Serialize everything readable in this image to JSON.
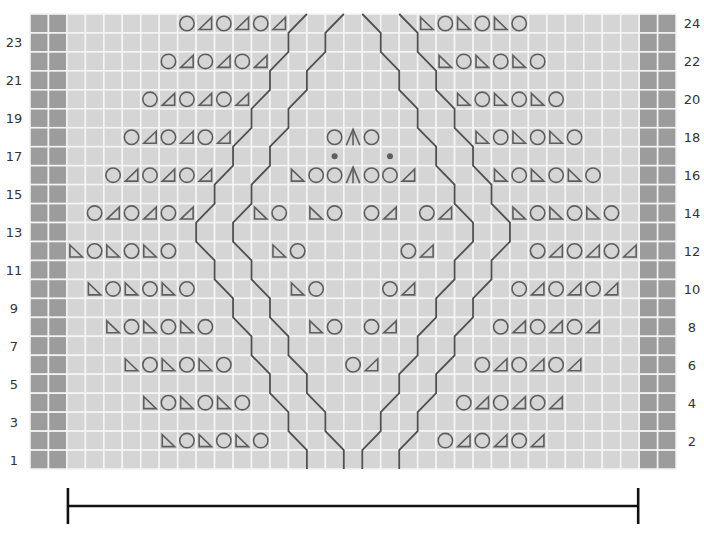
{
  "chart": {
    "type": "knitting-lace-chart",
    "columns": 35,
    "rows": 24,
    "edge_columns": {
      "left": [
        0,
        1
      ],
      "right": [
        33,
        34
      ]
    },
    "colors": {
      "cell": "#d5d5d5",
      "edge_cell": "#9c9c9c",
      "grid_line": "#f4f4f4",
      "symbol": "#5e5e5e",
      "cable_line": "#4f4f4f",
      "label": "#333333",
      "bracket": "#111111"
    },
    "row_labels": {
      "left": [
        "1",
        "3",
        "5",
        "7",
        "9",
        "11",
        "13",
        "15",
        "17",
        "19",
        "21",
        "23"
      ],
      "right": [
        "2",
        "4",
        "6",
        "8",
        "10",
        "12",
        "14",
        "16",
        "18",
        "20",
        "22",
        "24"
      ]
    },
    "symbol_legend": {
      "yo": "circle",
      "k2tog": "triangle-right-leaning",
      "ssk": "triangle-left-leaning",
      "cdd": "up-caret",
      "dot": "filled-dot"
    },
    "rows_data": {
      "24": [
        {
          "c": 8,
          "s": "yo"
        },
        {
          "c": 9,
          "s": "k2tog"
        },
        {
          "c": 10,
          "s": "yo"
        },
        {
          "c": 11,
          "s": "k2tog"
        },
        {
          "c": 12,
          "s": "yo"
        },
        {
          "c": 13,
          "s": "k2tog"
        },
        {
          "c": 21,
          "s": "ssk"
        },
        {
          "c": 22,
          "s": "yo"
        },
        {
          "c": 23,
          "s": "ssk"
        },
        {
          "c": 24,
          "s": "yo"
        },
        {
          "c": 25,
          "s": "ssk"
        },
        {
          "c": 26,
          "s": "yo"
        }
      ],
      "22": [
        {
          "c": 7,
          "s": "yo"
        },
        {
          "c": 8,
          "s": "k2tog"
        },
        {
          "c": 9,
          "s": "yo"
        },
        {
          "c": 10,
          "s": "k2tog"
        },
        {
          "c": 11,
          "s": "yo"
        },
        {
          "c": 12,
          "s": "k2tog"
        },
        {
          "c": 22,
          "s": "ssk"
        },
        {
          "c": 23,
          "s": "yo"
        },
        {
          "c": 24,
          "s": "ssk"
        },
        {
          "c": 25,
          "s": "yo"
        },
        {
          "c": 26,
          "s": "ssk"
        },
        {
          "c": 27,
          "s": "yo"
        }
      ],
      "20": [
        {
          "c": 6,
          "s": "yo"
        },
        {
          "c": 7,
          "s": "k2tog"
        },
        {
          "c": 8,
          "s": "yo"
        },
        {
          "c": 9,
          "s": "k2tog"
        },
        {
          "c": 10,
          "s": "yo"
        },
        {
          "c": 11,
          "s": "k2tog"
        },
        {
          "c": 23,
          "s": "ssk"
        },
        {
          "c": 24,
          "s": "yo"
        },
        {
          "c": 25,
          "s": "ssk"
        },
        {
          "c": 26,
          "s": "yo"
        },
        {
          "c": 27,
          "s": "ssk"
        },
        {
          "c": 28,
          "s": "yo"
        }
      ],
      "18": [
        {
          "c": 5,
          "s": "yo"
        },
        {
          "c": 6,
          "s": "k2tog"
        },
        {
          "c": 7,
          "s": "yo"
        },
        {
          "c": 8,
          "s": "k2tog"
        },
        {
          "c": 9,
          "s": "yo"
        },
        {
          "c": 10,
          "s": "k2tog"
        },
        {
          "c": 16,
          "s": "yo"
        },
        {
          "c": 17,
          "s": "cdd"
        },
        {
          "c": 18,
          "s": "yo"
        },
        {
          "c": 24,
          "s": "ssk"
        },
        {
          "c": 25,
          "s": "yo"
        },
        {
          "c": 26,
          "s": "ssk"
        },
        {
          "c": 27,
          "s": "yo"
        },
        {
          "c": 28,
          "s": "ssk"
        },
        {
          "c": 29,
          "s": "yo"
        }
      ],
      "17": [
        {
          "c": 16,
          "s": "dot"
        },
        {
          "c": 19,
          "s": "dot"
        }
      ],
      "16": [
        {
          "c": 4,
          "s": "yo"
        },
        {
          "c": 5,
          "s": "k2tog"
        },
        {
          "c": 6,
          "s": "yo"
        },
        {
          "c": 7,
          "s": "k2tog"
        },
        {
          "c": 8,
          "s": "yo"
        },
        {
          "c": 9,
          "s": "k2tog"
        },
        {
          "c": 14,
          "s": "ssk"
        },
        {
          "c": 15,
          "s": "yo"
        },
        {
          "c": 16,
          "s": "yo"
        },
        {
          "c": 17,
          "s": "cdd"
        },
        {
          "c": 18,
          "s": "yo"
        },
        {
          "c": 19,
          "s": "yo"
        },
        {
          "c": 20,
          "s": "k2tog"
        },
        {
          "c": 25,
          "s": "ssk"
        },
        {
          "c": 26,
          "s": "yo"
        },
        {
          "c": 27,
          "s": "ssk"
        },
        {
          "c": 28,
          "s": "yo"
        },
        {
          "c": 29,
          "s": "ssk"
        },
        {
          "c": 30,
          "s": "yo"
        }
      ],
      "14": [
        {
          "c": 3,
          "s": "yo"
        },
        {
          "c": 4,
          "s": "k2tog"
        },
        {
          "c": 5,
          "s": "yo"
        },
        {
          "c": 6,
          "s": "k2tog"
        },
        {
          "c": 7,
          "s": "yo"
        },
        {
          "c": 8,
          "s": "k2tog"
        },
        {
          "c": 12,
          "s": "ssk"
        },
        {
          "c": 13,
          "s": "yo"
        },
        {
          "c": 15,
          "s": "ssk"
        },
        {
          "c": 16,
          "s": "yo"
        },
        {
          "c": 18,
          "s": "yo"
        },
        {
          "c": 19,
          "s": "k2tog"
        },
        {
          "c": 21,
          "s": "yo"
        },
        {
          "c": 22,
          "s": "k2tog"
        },
        {
          "c": 26,
          "s": "ssk"
        },
        {
          "c": 27,
          "s": "yo"
        },
        {
          "c": 28,
          "s": "ssk"
        },
        {
          "c": 29,
          "s": "yo"
        },
        {
          "c": 30,
          "s": "ssk"
        },
        {
          "c": 31,
          "s": "yo"
        }
      ],
      "12": [
        {
          "c": 2,
          "s": "ssk"
        },
        {
          "c": 3,
          "s": "yo"
        },
        {
          "c": 4,
          "s": "ssk"
        },
        {
          "c": 5,
          "s": "yo"
        },
        {
          "c": 6,
          "s": "ssk"
        },
        {
          "c": 7,
          "s": "yo"
        },
        {
          "c": 13,
          "s": "ssk"
        },
        {
          "c": 14,
          "s": "yo"
        },
        {
          "c": 20,
          "s": "yo"
        },
        {
          "c": 21,
          "s": "k2tog"
        },
        {
          "c": 27,
          "s": "yo"
        },
        {
          "c": 28,
          "s": "k2tog"
        },
        {
          "c": 29,
          "s": "yo"
        },
        {
          "c": 30,
          "s": "k2tog"
        },
        {
          "c": 31,
          "s": "yo"
        },
        {
          "c": 32,
          "s": "k2tog"
        }
      ],
      "10": [
        {
          "c": 3,
          "s": "ssk"
        },
        {
          "c": 4,
          "s": "yo"
        },
        {
          "c": 5,
          "s": "ssk"
        },
        {
          "c": 6,
          "s": "yo"
        },
        {
          "c": 7,
          "s": "ssk"
        },
        {
          "c": 8,
          "s": "yo"
        },
        {
          "c": 14,
          "s": "ssk"
        },
        {
          "c": 15,
          "s": "yo"
        },
        {
          "c": 19,
          "s": "yo"
        },
        {
          "c": 20,
          "s": "k2tog"
        },
        {
          "c": 26,
          "s": "yo"
        },
        {
          "c": 27,
          "s": "k2tog"
        },
        {
          "c": 28,
          "s": "yo"
        },
        {
          "c": 29,
          "s": "k2tog"
        },
        {
          "c": 30,
          "s": "yo"
        },
        {
          "c": 31,
          "s": "k2tog"
        }
      ],
      "8": [
        {
          "c": 4,
          "s": "ssk"
        },
        {
          "c": 5,
          "s": "yo"
        },
        {
          "c": 6,
          "s": "ssk"
        },
        {
          "c": 7,
          "s": "yo"
        },
        {
          "c": 8,
          "s": "ssk"
        },
        {
          "c": 9,
          "s": "yo"
        },
        {
          "c": 15,
          "s": "ssk"
        },
        {
          "c": 16,
          "s": "yo"
        },
        {
          "c": 18,
          "s": "yo"
        },
        {
          "c": 19,
          "s": "k2tog"
        },
        {
          "c": 25,
          "s": "yo"
        },
        {
          "c": 26,
          "s": "k2tog"
        },
        {
          "c": 27,
          "s": "yo"
        },
        {
          "c": 28,
          "s": "k2tog"
        },
        {
          "c": 29,
          "s": "yo"
        },
        {
          "c": 30,
          "s": "k2tog"
        }
      ],
      "6": [
        {
          "c": 5,
          "s": "ssk"
        },
        {
          "c": 6,
          "s": "yo"
        },
        {
          "c": 7,
          "s": "ssk"
        },
        {
          "c": 8,
          "s": "yo"
        },
        {
          "c": 9,
          "s": "ssk"
        },
        {
          "c": 10,
          "s": "yo"
        },
        {
          "c": 17,
          "s": "yo"
        },
        {
          "c": 18,
          "s": "k2tog"
        },
        {
          "c": 24,
          "s": "yo"
        },
        {
          "c": 25,
          "s": "k2tog"
        },
        {
          "c": 26,
          "s": "yo"
        },
        {
          "c": 27,
          "s": "k2tog"
        },
        {
          "c": 28,
          "s": "yo"
        },
        {
          "c": 29,
          "s": "k2tog"
        }
      ],
      "4": [
        {
          "c": 6,
          "s": "ssk"
        },
        {
          "c": 7,
          "s": "yo"
        },
        {
          "c": 8,
          "s": "ssk"
        },
        {
          "c": 9,
          "s": "yo"
        },
        {
          "c": 10,
          "s": "ssk"
        },
        {
          "c": 11,
          "s": "yo"
        },
        {
          "c": 23,
          "s": "yo"
        },
        {
          "c": 24,
          "s": "k2tog"
        },
        {
          "c": 25,
          "s": "yo"
        },
        {
          "c": 26,
          "s": "k2tog"
        },
        {
          "c": 27,
          "s": "yo"
        },
        {
          "c": 28,
          "s": "k2tog"
        }
      ],
      "2": [
        {
          "c": 7,
          "s": "ssk"
        },
        {
          "c": 8,
          "s": "yo"
        },
        {
          "c": 9,
          "s": "ssk"
        },
        {
          "c": 10,
          "s": "yo"
        },
        {
          "c": 11,
          "s": "ssk"
        },
        {
          "c": 12,
          "s": "yo"
        },
        {
          "c": 22,
          "s": "yo"
        },
        {
          "c": 23,
          "s": "k2tog"
        },
        {
          "c": 24,
          "s": "yo"
        },
        {
          "c": 25,
          "s": "k2tog"
        },
        {
          "c": 26,
          "s": "yo"
        },
        {
          "c": 27,
          "s": "k2tog"
        }
      ]
    },
    "cable_lines": [
      {
        "name": "outer-left",
        "points": [
          [
            15,
            0
          ],
          [
            14,
            1
          ],
          [
            14,
            2
          ],
          [
            13,
            3
          ],
          [
            13,
            4
          ],
          [
            12,
            5
          ],
          [
            12,
            6
          ],
          [
            11,
            7
          ],
          [
            11,
            8
          ],
          [
            10,
            9
          ],
          [
            10,
            10
          ],
          [
            9,
            11
          ],
          [
            9,
            12
          ],
          [
            10,
            13
          ],
          [
            10,
            14
          ],
          [
            11,
            15
          ],
          [
            11,
            16
          ],
          [
            12,
            17
          ],
          [
            12,
            18
          ],
          [
            13,
            19
          ],
          [
            13,
            20
          ],
          [
            14,
            21
          ],
          [
            14,
            22
          ],
          [
            15,
            23
          ],
          [
            15,
            24
          ]
        ]
      },
      {
        "name": "inner-left",
        "points": [
          [
            17,
            0
          ],
          [
            16,
            1
          ],
          [
            16,
            2
          ],
          [
            15,
            3
          ],
          [
            15,
            4
          ],
          [
            14,
            5
          ],
          [
            14,
            6
          ],
          [
            13,
            7
          ],
          [
            13,
            8
          ],
          [
            12,
            9
          ],
          [
            12,
            10
          ],
          [
            11,
            11
          ],
          [
            11,
            12
          ],
          [
            12,
            13
          ],
          [
            12,
            14
          ],
          [
            13,
            15
          ],
          [
            13,
            16
          ],
          [
            14,
            17
          ],
          [
            14,
            18
          ],
          [
            15,
            19
          ],
          [
            15,
            20
          ],
          [
            16,
            21
          ],
          [
            16,
            22
          ],
          [
            17,
            23
          ],
          [
            17,
            24
          ]
        ]
      },
      {
        "name": "inner-right",
        "points": [
          [
            18,
            0
          ],
          [
            19,
            1
          ],
          [
            19,
            2
          ],
          [
            20,
            3
          ],
          [
            20,
            4
          ],
          [
            21,
            5
          ],
          [
            21,
            6
          ],
          [
            22,
            7
          ],
          [
            22,
            8
          ],
          [
            23,
            9
          ],
          [
            23,
            10
          ],
          [
            24,
            11
          ],
          [
            24,
            12
          ],
          [
            23,
            13
          ],
          [
            23,
            14
          ],
          [
            22,
            15
          ],
          [
            22,
            16
          ],
          [
            21,
            17
          ],
          [
            21,
            18
          ],
          [
            20,
            19
          ],
          [
            20,
            20
          ],
          [
            19,
            21
          ],
          [
            19,
            22
          ],
          [
            18,
            23
          ],
          [
            18,
            24
          ]
        ]
      },
      {
        "name": "outer-right",
        "points": [
          [
            20,
            0
          ],
          [
            21,
            1
          ],
          [
            21,
            2
          ],
          [
            22,
            3
          ],
          [
            22,
            4
          ],
          [
            23,
            5
          ],
          [
            23,
            6
          ],
          [
            24,
            7
          ],
          [
            24,
            8
          ],
          [
            25,
            9
          ],
          [
            25,
            10
          ],
          [
            26,
            11
          ],
          [
            26,
            12
          ],
          [
            25,
            13
          ],
          [
            25,
            14
          ],
          [
            24,
            15
          ],
          [
            24,
            16
          ],
          [
            23,
            17
          ],
          [
            23,
            18
          ],
          [
            22,
            19
          ],
          [
            22,
            20
          ],
          [
            21,
            21
          ],
          [
            21,
            22
          ],
          [
            20,
            23
          ],
          [
            20,
            24
          ]
        ]
      }
    ],
    "width_bracket": {
      "label": "",
      "from_col": 2,
      "to_col": 33
    }
  }
}
